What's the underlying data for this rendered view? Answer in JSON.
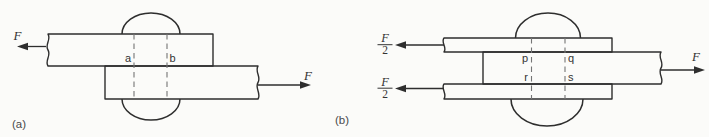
{
  "colors": {
    "background": "#fbfbf9",
    "line": "#2e2e2e",
    "dashed_line": "#757575",
    "label": "#333333"
  },
  "diagram_a": {
    "caption": "(a)",
    "left_force": "F",
    "right_force": "F",
    "section_point_a": "a",
    "section_point_b": "b"
  },
  "diagram_b": {
    "caption": "(b)",
    "top_force": {
      "numerator": "F",
      "denominator": "2"
    },
    "bottom_force": {
      "numerator": "F",
      "denominator": "2"
    },
    "right_force": "F",
    "section_point_p": "p",
    "section_point_q": "q",
    "section_point_r": "r",
    "section_point_s": "s"
  }
}
